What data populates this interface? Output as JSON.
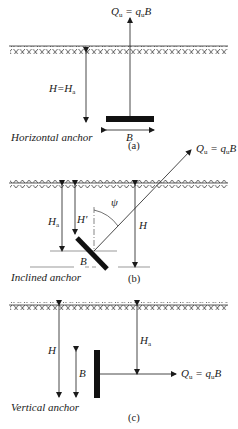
{
  "panels": [
    {
      "id": "a",
      "caption": "(a)",
      "type_label": "Horizontal anchor",
      "load_label": "Q",
      "load_sub": "u",
      "load_eq": " = q",
      "load_eq_sub": "u",
      "load_eq_tail": "B",
      "depth_label": "H=H",
      "depth_sub": "a",
      "width_label": "B"
    },
    {
      "id": "b",
      "caption": "(b)",
      "type_label": "Inclined anchor",
      "load_label": "Q",
      "load_sub": "u",
      "load_eq": " = q",
      "load_eq_sub": "u",
      "load_eq_tail": "B",
      "depth_a_label": "H",
      "depth_a_sub": "a",
      "depth_prime_label": "H′",
      "depth_label": "H",
      "angle_label": "ψ",
      "width_label": "B"
    },
    {
      "id": "c",
      "caption": "(c)",
      "type_label": "Vertical anchor",
      "load_label": "Q",
      "load_sub": "u",
      "load_eq": " = q",
      "load_eq_sub": "u",
      "load_eq_tail": "B",
      "depth_label": "H",
      "depth_a_label": "H",
      "depth_a_sub": "a",
      "width_label": "B"
    }
  ]
}
